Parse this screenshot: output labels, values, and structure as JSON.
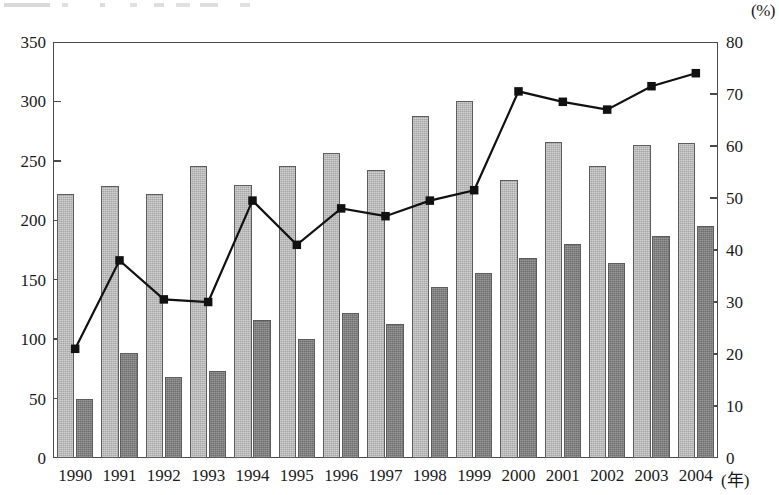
{
  "chart_data": {
    "type": "bar",
    "title": "",
    "subtitle": "",
    "xlabel": "(年)",
    "ylabel": "",
    "y2label": "(%)",
    "categories": [
      "1990",
      "1991",
      "1992",
      "1993",
      "1994",
      "1995",
      "1996",
      "1997",
      "1998",
      "1999",
      "2000",
      "2001",
      "2002",
      "2003",
      "2004"
    ],
    "ylim": [
      0,
      350
    ],
    "yticks": [
      0,
      50,
      100,
      150,
      200,
      250,
      300,
      350
    ],
    "y2lim": [
      0,
      80
    ],
    "y2ticks": [
      0,
      10,
      20,
      30,
      40,
      50,
      60,
      70,
      80
    ],
    "grid": false,
    "legend": "none",
    "series": [
      {
        "name": "light-gray-bars",
        "kind": "bar",
        "axis": "left",
        "color": "#a6a6a6",
        "values": [
          222,
          229,
          222,
          246,
          230,
          246,
          257,
          242,
          288,
          300,
          234,
          266,
          246,
          263,
          265
        ]
      },
      {
        "name": "dark-gray-bars",
        "kind": "bar",
        "axis": "left",
        "color": "#6d6d6d",
        "values": [
          50,
          88,
          68,
          73,
          116,
          100,
          122,
          113,
          144,
          156,
          168,
          180,
          164,
          187,
          195
        ]
      },
      {
        "name": "percentage-line",
        "kind": "line",
        "axis": "right",
        "color": "#111111",
        "marker": "square",
        "values": [
          21,
          38,
          30.5,
          30,
          49.5,
          41,
          48,
          46.5,
          49.5,
          51.5,
          70.5,
          68.5,
          67,
          71.5,
          74
        ]
      }
    ]
  },
  "axes": {
    "left_unit": "",
    "right_unit": "(%)",
    "x_unit": "(年)"
  }
}
